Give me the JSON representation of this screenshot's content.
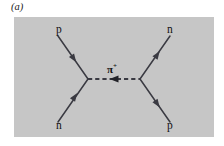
{
  "figure": {
    "panel_label": "(a)",
    "caption_visible": false
  },
  "colors": {
    "panel_background": "#c6c6c6",
    "page_background": "#ffffff",
    "line": "#3a3a42",
    "text": "#111111"
  },
  "diagram": {
    "type": "feynman-diagram",
    "process": "p n -> n p",
    "panel": {
      "x": 14,
      "y": 17,
      "width": 200,
      "height": 120
    },
    "vertices": [
      {
        "name": "left-vertex",
        "x": 88,
        "y": 79
      },
      {
        "name": "right-vertex",
        "x": 140,
        "y": 79
      }
    ],
    "mediator": {
      "label_base": "π",
      "label_sup": "+",
      "line_style": "dashed",
      "arrow_direction": "left",
      "x1": 88,
      "y1": 79,
      "x2": 140,
      "y2": 79
    },
    "legs": [
      {
        "name": "incoming-proton",
        "label": "p",
        "position": "upper-left",
        "x1": 58,
        "y1": 36,
        "x2": 88,
        "y2": 79,
        "arrow_direction": "toward-vertex",
        "label_x": 56,
        "label_y": 23
      },
      {
        "name": "incoming-neutron",
        "label": "n",
        "position": "lower-left",
        "x1": 58,
        "y1": 122,
        "x2": 88,
        "y2": 79,
        "arrow_direction": "toward-vertex",
        "label_x": 56,
        "label_y": 119
      },
      {
        "name": "outgoing-neutron",
        "label": "n",
        "position": "upper-right",
        "x1": 140,
        "y1": 79,
        "x2": 170,
        "y2": 36,
        "arrow_direction": "away-from-vertex",
        "label_x": 167,
        "label_y": 23
      },
      {
        "name": "outgoing-proton",
        "label": "p",
        "position": "lower-right",
        "x1": 140,
        "y1": 79,
        "x2": 170,
        "y2": 122,
        "arrow_direction": "away-from-vertex",
        "label_x": 167,
        "label_y": 119
      }
    ]
  }
}
